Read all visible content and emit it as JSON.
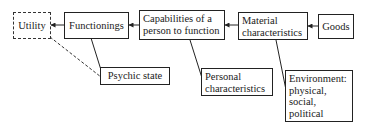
{
  "diagram": {
    "nodes": {
      "utility": {
        "label": "Utility",
        "style": "dashed"
      },
      "functionings": {
        "label": "Functionings"
      },
      "capabilities": {
        "line1": "Capabilities of a",
        "line2": "person to function"
      },
      "material": {
        "line1": "Material",
        "line2": "characteristics"
      },
      "goods": {
        "label": "Goods"
      },
      "psychic": {
        "label": "Psychic state"
      },
      "personal": {
        "line1": "Personal",
        "line2": "characteristics"
      },
      "environment": {
        "line1": "Environment:",
        "line2": "physical,",
        "line3": "social,",
        "line4": "political"
      }
    },
    "edges": [
      {
        "from": "functionings",
        "to": "utility",
        "style": "solid-arrow"
      },
      {
        "from": "capabilities",
        "to": "functionings",
        "style": "solid-arrow"
      },
      {
        "from": "material",
        "to": "capabilities",
        "style": "solid-arrow"
      },
      {
        "from": "goods",
        "to": "material",
        "style": "solid-arrow"
      },
      {
        "from": "functionings",
        "to": "psychic",
        "style": "solid"
      },
      {
        "from": "utility",
        "to": "psychic",
        "style": "dashed"
      },
      {
        "from": "capabilities",
        "to": "personal",
        "style": "solid"
      },
      {
        "from": "material",
        "to": "environment",
        "style": "solid"
      }
    ],
    "colors": {
      "stroke": "#222222",
      "background": "#ffffff"
    }
  }
}
